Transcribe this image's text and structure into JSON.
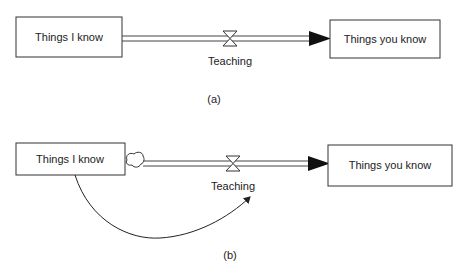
{
  "diagram_a": {
    "caption": "(a)",
    "stock_source": {
      "label": "Things I know"
    },
    "flow": {
      "label": "Teaching"
    },
    "stock_target": {
      "label": "Things you know"
    }
  },
  "diagram_b": {
    "caption": "(b)",
    "stock_source": {
      "label": "Things I know"
    },
    "source_cloud": {
      "icon": "cloud-icon"
    },
    "flow": {
      "label": "Teaching"
    },
    "stock_target": {
      "label": "Things you know"
    },
    "link": {
      "from": "Things I know",
      "to": "Teaching"
    }
  },
  "colors": {
    "stroke": "#333333",
    "text": "#222222",
    "background": "#ffffff"
  }
}
